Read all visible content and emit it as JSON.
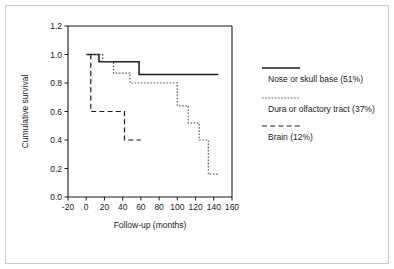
{
  "chart_data": {
    "type": "line",
    "title": "",
    "subtitle": "",
    "xlabel": "Follow-up (months)",
    "ylabel": "Cumulative survival",
    "xlim": [
      -20,
      160
    ],
    "ylim": [
      0.0,
      1.2
    ],
    "xticks": [
      -20,
      0,
      20,
      40,
      60,
      80,
      100,
      120,
      140,
      160
    ],
    "xtick_labels": [
      "-20",
      "0",
      "20",
      "40",
      "60",
      "80",
      "100",
      "120",
      "140",
      "160"
    ],
    "yticks": [
      0.0,
      0.2,
      0.4,
      0.6,
      0.8,
      1.0,
      1.2
    ],
    "ytick_labels": [
      "0.0",
      "0.2",
      "0.4",
      "0.6",
      "0.8",
      "1.0",
      "1.2"
    ],
    "grid": false,
    "legend_position": "right",
    "series": [
      {
        "name": "Nose or skull base (51%)",
        "style": "solid",
        "color": "#1a1a1a",
        "percent": "51%",
        "x": [
          0,
          14,
          14,
          58,
          58,
          145
        ],
        "y": [
          1.0,
          1.0,
          0.95,
          0.95,
          0.86,
          0.86
        ]
      },
      {
        "name": "Dura or olfactory tract (37%)",
        "style": "dotted",
        "color": "#5a5a5a",
        "percent": "37%",
        "x": [
          0,
          18,
          18,
          30,
          30,
          48,
          48,
          92,
          92,
          100,
          100,
          112,
          112,
          124,
          124,
          134,
          134,
          146
        ],
        "y": [
          1.0,
          1.0,
          0.95,
          0.95,
          0.87,
          0.87,
          0.8,
          0.8,
          0.8,
          0.8,
          0.64,
          0.64,
          0.52,
          0.52,
          0.4,
          0.4,
          0.16,
          0.16
        ]
      },
      {
        "name": "Brain (12%)",
        "style": "dashed",
        "color": "#1a1a1a",
        "percent": "12%",
        "x": [
          5,
          5,
          5,
          42,
          42,
          60
        ],
        "y": [
          1.0,
          0.6,
          0.6,
          0.6,
          0.4,
          0.4
        ]
      }
    ]
  },
  "legend": {
    "items": [
      {
        "label": "Nose or skull base (51%)",
        "style": "solid"
      },
      {
        "label": "Dura or olfactory tract (37%)",
        "style": "dotted"
      },
      {
        "label": "Brain (12%)",
        "style": "dashed"
      }
    ]
  },
  "colors": {
    "frame": "#c9c9c9",
    "axis": "#1a1a1a",
    "solid_series": "#1a1a1a",
    "dotted_series": "#5a5a5a",
    "dashed_series": "#1a1a1a",
    "background": "#ffffff"
  }
}
